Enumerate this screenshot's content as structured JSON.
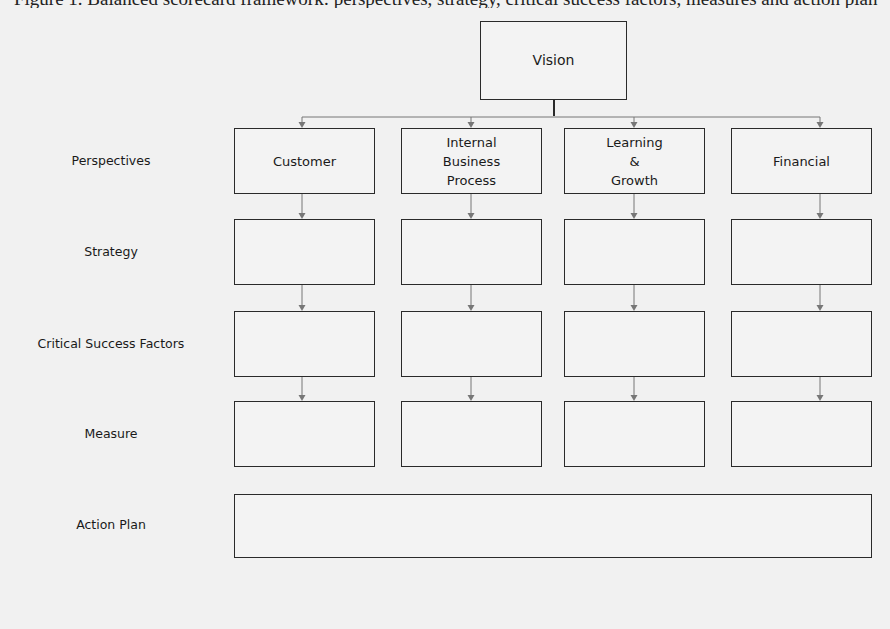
{
  "caption": "Figure 1. Balanced scorecard framework: perspectives, strategy, critical success factors, measures and action plan",
  "vision": {
    "label": "Vision"
  },
  "row_labels": [
    {
      "key": "perspectives",
      "label": "Perspectives"
    },
    {
      "key": "strategy",
      "label": "Strategy"
    },
    {
      "key": "csf",
      "label": "Critical Success Factors"
    },
    {
      "key": "measure",
      "label": "Measure"
    },
    {
      "key": "action",
      "label": "Action Plan"
    }
  ],
  "perspectives": [
    {
      "label": "Customer"
    },
    {
      "label": "Internal\nBusiness\nProcess"
    },
    {
      "label": "Learning\n&\nGrowth"
    },
    {
      "label": "Financial"
    }
  ],
  "colors": {
    "line": "#2a2a2a",
    "connector": "#777777",
    "background": "#f1f1f1"
  }
}
